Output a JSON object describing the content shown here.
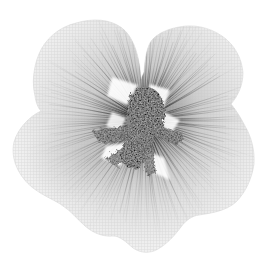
{
  "image": {
    "type": "photograph",
    "description": "Black-and-white X-ray photograph of a five-petaled mallow flower, centered on a white background, with translucent mesh-textured petals, dark veins radiating from the middle, and a dark grainy central stamen column",
    "subject": "flower-xray",
    "background_color": "#ffffff"
  },
  "palette": {
    "background": "#ffffff",
    "petal_edge": "#f2f2f2",
    "petal_mid": "#cccccc",
    "petal_base": "#8f8f8f",
    "mesh_line": "#c4c4c4",
    "vein_dark": "#1c1c1c",
    "center_blob": "#171717",
    "sepal_arm": "#2e2e2e",
    "gap_highlight": "#ffffff"
  },
  "flower": {
    "center": {
      "x": 144,
      "y": 120
    },
    "petal_count": 5,
    "vein_fans": [
      {
        "name": "upper-left-petal",
        "from": 196,
        "to": 258,
        "count": 26,
        "r0": 16,
        "r1": 78,
        "rvar": 42
      },
      {
        "name": "upper-right-petal",
        "from": 263,
        "to": 331,
        "count": 32,
        "r0": 16,
        "r1": 82,
        "rvar": 46
      },
      {
        "name": "right-petal",
        "from": -18,
        "to": 51,
        "count": 30,
        "r0": 18,
        "r1": 78,
        "rvar": 42
      },
      {
        "name": "bottom-petal",
        "from": 55,
        "to": 108,
        "count": 26,
        "r0": 20,
        "r1": 92,
        "rvar": 44
      },
      {
        "name": "lower-left-petal",
        "from": 110,
        "to": 193,
        "count": 36,
        "r0": 18,
        "r1": 88,
        "rvar": 46
      }
    ]
  }
}
